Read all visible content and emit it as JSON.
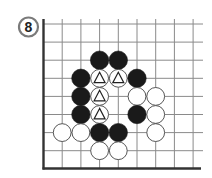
{
  "diagram": {
    "number_label": "8",
    "type": "go-board-fragment",
    "grid": {
      "origin_x": 43.5,
      "origin_y": 24,
      "spacing_x": 18.7,
      "spacing_y": 18.1,
      "columns": 9,
      "rows": 8,
      "left_edge": true,
      "bottom_edge": true
    },
    "colors": {
      "line": "#8a8a8a",
      "border": "#333333",
      "black_stone": "#1a1a1a",
      "white_stone": "#ffffff",
      "stone_outline": "#444444",
      "label_ring": "#7a7a7a"
    },
    "stones": [
      {
        "color": "black",
        "col": 3,
        "row": 2,
        "marker": ""
      },
      {
        "color": "black",
        "col": 4,
        "row": 2,
        "marker": ""
      },
      {
        "color": "black",
        "col": 2,
        "row": 3,
        "marker": ""
      },
      {
        "color": "white",
        "col": 3,
        "row": 3,
        "marker": "triangle"
      },
      {
        "color": "white",
        "col": 4,
        "row": 3,
        "marker": "triangle"
      },
      {
        "color": "black",
        "col": 5,
        "row": 3,
        "marker": ""
      },
      {
        "color": "black",
        "col": 2,
        "row": 4,
        "marker": ""
      },
      {
        "color": "white",
        "col": 3,
        "row": 4,
        "marker": "triangle"
      },
      {
        "color": "white",
        "col": 5,
        "row": 4,
        "marker": ""
      },
      {
        "color": "white",
        "col": 6,
        "row": 4,
        "marker": ""
      },
      {
        "color": "black",
        "col": 2,
        "row": 5,
        "marker": ""
      },
      {
        "color": "white",
        "col": 3,
        "row": 5,
        "marker": "triangle"
      },
      {
        "color": "black",
        "col": 5,
        "row": 5,
        "marker": ""
      },
      {
        "color": "white",
        "col": 6,
        "row": 5,
        "marker": ""
      },
      {
        "color": "white",
        "col": 1,
        "row": 6,
        "marker": ""
      },
      {
        "color": "white",
        "col": 2,
        "row": 6,
        "marker": ""
      },
      {
        "color": "black",
        "col": 3,
        "row": 6,
        "marker": ""
      },
      {
        "color": "black",
        "col": 4,
        "row": 6,
        "marker": ""
      },
      {
        "color": "white",
        "col": 6,
        "row": 6,
        "marker": ""
      },
      {
        "color": "white",
        "col": 3,
        "row": 7,
        "marker": ""
      },
      {
        "color": "white",
        "col": 4,
        "row": 7,
        "marker": ""
      }
    ]
  }
}
